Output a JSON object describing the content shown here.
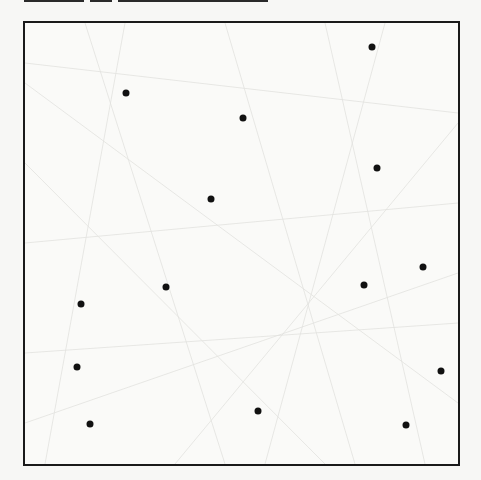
{
  "figure": {
    "frame": {
      "left": 23,
      "top": 21,
      "right": 460,
      "bottom": 466,
      "stroke": "#1a1a1a"
    },
    "dot_color": "#111111",
    "dots": [
      {
        "x": 372,
        "y": 47
      },
      {
        "x": 126,
        "y": 93
      },
      {
        "x": 243,
        "y": 118
      },
      {
        "x": 377,
        "y": 168
      },
      {
        "x": 211,
        "y": 199
      },
      {
        "x": 423,
        "y": 267
      },
      {
        "x": 166,
        "y": 287
      },
      {
        "x": 364,
        "y": 285
      },
      {
        "x": 81,
        "y": 304
      },
      {
        "x": 77,
        "y": 367
      },
      {
        "x": 441,
        "y": 371
      },
      {
        "x": 258,
        "y": 411
      },
      {
        "x": 90,
        "y": 424
      },
      {
        "x": 406,
        "y": 425
      }
    ]
  }
}
